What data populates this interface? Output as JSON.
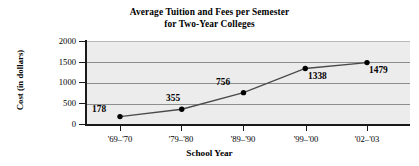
{
  "chart_data": {
    "type": "line",
    "title": "Average Tuition and Fees per Semester for Two-Year Colleges",
    "title_lines": [
      "Average Tuition and Fees per Semester",
      "for Two-Year Colleges"
    ],
    "xlabel": "School Year",
    "ylabel": "Cost (in dollars)",
    "categories": [
      "'69–'70",
      "'79–'80",
      "'89–'90",
      "'99–'00",
      "'02–'03"
    ],
    "values": [
      178,
      355,
      756,
      1338,
      1479
    ],
    "point_labels": [
      "178",
      "355",
      "756",
      "1338",
      "1479"
    ],
    "ylim": [
      0,
      2000
    ],
    "yticks": [
      2000,
      1500,
      1000,
      500,
      0
    ],
    "ytick_labels": [
      "2000",
      "1500",
      "1000",
      "500",
      "0"
    ],
    "grid": true,
    "legend": false,
    "colors": {
      "plot_background": "#ececec",
      "gridline": "#8d8d8d",
      "axis": "#1a1a1a",
      "series_line": "#4a4a4a",
      "marker": "#000000",
      "page_background": "#ffffff"
    }
  }
}
